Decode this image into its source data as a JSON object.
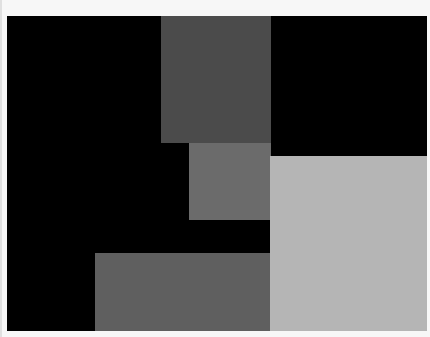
{
  "image": {
    "description": "Abstract composition of gray rectangles on a black field",
    "background_color": "#f7f7f7",
    "frame": {
      "x": 7,
      "y": 16,
      "width": 420,
      "height": 315,
      "color": "#000000"
    },
    "blocks": [
      {
        "name": "dark-gray-top-block",
        "x": 161,
        "y": 16,
        "width": 110,
        "height": 127,
        "color": "#4b4b4b"
      },
      {
        "name": "medium-gray-middle-block",
        "x": 189,
        "y": 143,
        "width": 82,
        "height": 77,
        "color": "#6b6b6b"
      },
      {
        "name": "light-gray-right-block",
        "x": 270,
        "y": 156,
        "width": 157,
        "height": 175,
        "color": "#b5b5b5"
      },
      {
        "name": "gray-bottom-block",
        "x": 95,
        "y": 253,
        "width": 175,
        "height": 78,
        "color": "#5f5f5f"
      }
    ]
  }
}
